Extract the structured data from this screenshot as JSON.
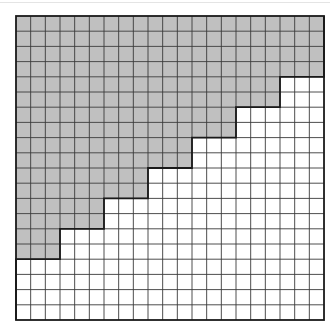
{
  "diagram": {
    "type": "grid-staircase",
    "grid": {
      "columns": 21,
      "rows": 20,
      "origin": [
        16,
        16
      ],
      "cell_width": 14.667,
      "cell_height": 15.2
    },
    "colors": {
      "background": "#ffffff",
      "shaded_fill": "#c0c0c0",
      "grid_line": "#3a3a3a",
      "border": "#1a1a1a",
      "top_rule": "#e4e4e4"
    },
    "shaded_columns_per_row": [
      21,
      21,
      21,
      21,
      18,
      18,
      15,
      15,
      12,
      12,
      9,
      9,
      6,
      6,
      3,
      3,
      0,
      0,
      0,
      0
    ]
  }
}
